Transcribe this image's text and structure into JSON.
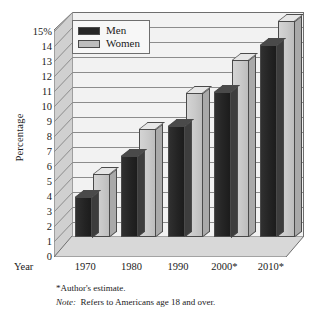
{
  "chart_data": {
    "type": "bar",
    "title": "",
    "xlabel": "Year",
    "ylabel": "Percentage",
    "categories": [
      "1970",
      "1980",
      "1990",
      "2000*",
      "2010*"
    ],
    "series": [
      {
        "name": "Men",
        "values": [
          2.7,
          5.4,
          7.4,
          9.7,
          12.8
        ]
      },
      {
        "name": "Women",
        "values": [
          4.2,
          7.2,
          9.6,
          11.8,
          14.4
        ]
      }
    ],
    "ylim": [
      0,
      15
    ],
    "y_ticks": [
      "0",
      "1",
      "2",
      "3",
      "4",
      "5",
      "6",
      "7",
      "8",
      "9",
      "10",
      "11",
      "12",
      "13",
      "14",
      "15%"
    ],
    "y_tick_values": [
      0,
      1,
      2,
      3,
      4,
      5,
      6,
      7,
      8,
      9,
      10,
      11,
      12,
      13,
      14,
      15
    ],
    "grid": true,
    "legend_position": "top-left",
    "style": "3d-clustered-column",
    "colors": {
      "men": "#262626",
      "women": "#bdbdbd",
      "gridline": "#8c8c8c",
      "plot_background": "#f2f2f2",
      "axis_line": "#6e6e6e"
    },
    "annotations": [
      "*Author's estimate.",
      "Note: Refers to Americans age 18 and over."
    ]
  },
  "legend": {
    "items": [
      {
        "label": "Men",
        "swatch": "men"
      },
      {
        "label": "Women",
        "swatch": "women"
      }
    ]
  },
  "footnotes": {
    "estimate": "*Author's estimate.",
    "note_label": "Note:",
    "note_text": "Refers to Americans age 18 and over."
  }
}
